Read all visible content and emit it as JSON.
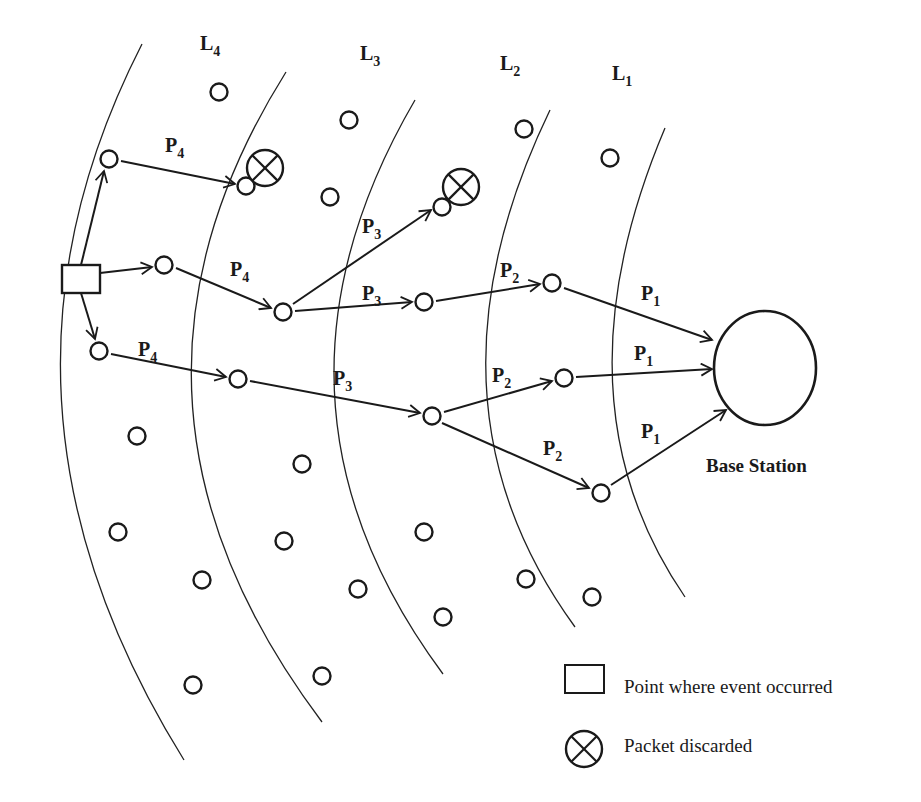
{
  "diagram": {
    "layers": [
      {
        "label": "L",
        "sub": "4",
        "x": 200,
        "y": 50
      },
      {
        "label": "L",
        "sub": "3",
        "x": 360,
        "y": 60
      },
      {
        "label": "L",
        "sub": "2",
        "x": 500,
        "y": 70
      },
      {
        "label": "L",
        "sub": "1",
        "x": 612,
        "y": 80
      }
    ],
    "boundaries": [
      "M142,44 Q-40,400 184,760",
      "M286,72 Q80,400 322,722",
      "M415,100 Q240,400 443,674",
      "M550,110 Q410,400 575,627",
      "M665,128 Q550,400 685,597"
    ],
    "event_point": {
      "x": 62,
      "y": 265,
      "w": 38,
      "h": 28
    },
    "nodes": [
      {
        "x": 219,
        "y": 92
      },
      {
        "x": 349,
        "y": 120
      },
      {
        "x": 524,
        "y": 129
      },
      {
        "x": 610,
        "y": 158
      },
      {
        "x": 109,
        "y": 159
      },
      {
        "x": 246,
        "y": 186
      },
      {
        "x": 330,
        "y": 197
      },
      {
        "x": 442,
        "y": 207
      },
      {
        "x": 164,
        "y": 265
      },
      {
        "x": 283,
        "y": 312
      },
      {
        "x": 424,
        "y": 302
      },
      {
        "x": 552,
        "y": 283
      },
      {
        "x": 99,
        "y": 351
      },
      {
        "x": 238,
        "y": 379
      },
      {
        "x": 432,
        "y": 416
      },
      {
        "x": 564,
        "y": 378
      },
      {
        "x": 601,
        "y": 493
      },
      {
        "x": 137,
        "y": 436
      },
      {
        "x": 302,
        "y": 464
      },
      {
        "x": 118,
        "y": 532
      },
      {
        "x": 284,
        "y": 541
      },
      {
        "x": 424,
        "y": 532
      },
      {
        "x": 202,
        "y": 580
      },
      {
        "x": 358,
        "y": 589
      },
      {
        "x": 526,
        "y": 579
      },
      {
        "x": 592,
        "y": 597
      },
      {
        "x": 443,
        "y": 617
      },
      {
        "x": 193,
        "y": 685
      },
      {
        "x": 322,
        "y": 676
      }
    ],
    "discarded": [
      {
        "x": 265,
        "y": 168,
        "r": 18
      },
      {
        "x": 461,
        "y": 187,
        "r": 18
      }
    ],
    "edges": [
      {
        "path": "M81,265 L104,171",
        "label": null
      },
      {
        "path": "M100,273 L152,267",
        "label": null
      },
      {
        "path": "M81,293 L95,339",
        "label": null
      },
      {
        "path": "M121,161 L235,184",
        "label": {
          "p": "P",
          "sub": "4",
          "x": 165,
          "y": 152
        }
      },
      {
        "path": "M176,268 L271,308",
        "label": {
          "p": "P",
          "sub": "4",
          "x": 230,
          "y": 276
        }
      },
      {
        "path": "M111,354 L226,377",
        "label": {
          "p": "P",
          "sub": "4",
          "x": 138,
          "y": 356
        }
      },
      {
        "path": "M293,304 L431,210",
        "label": {
          "p": "P",
          "sub": "3",
          "x": 362,
          "y": 233
        }
      },
      {
        "path": "M295,311 L412,302",
        "label": {
          "p": "P",
          "sub": "3",
          "x": 362,
          "y": 300
        }
      },
      {
        "path": "M250,381 L420,413",
        "label": {
          "p": "P",
          "sub": "3",
          "x": 333,
          "y": 385
        }
      },
      {
        "path": "M436,301 L540,284",
        "label": {
          "p": "P",
          "sub": "2",
          "x": 500,
          "y": 277
        }
      },
      {
        "path": "M444,412 L552,381",
        "label": {
          "p": "P",
          "sub": "2",
          "x": 492,
          "y": 382
        }
      },
      {
        "path": "M442,423 L589,488",
        "label": {
          "p": "P",
          "sub": "2",
          "x": 543,
          "y": 455
        }
      },
      {
        "path": "M564,288 L712,340",
        "label": {
          "p": "P",
          "sub": "1",
          "x": 641,
          "y": 300
        }
      },
      {
        "path": "M576,377 L712,369",
        "label": {
          "p": "P",
          "sub": "1",
          "x": 634,
          "y": 360
        }
      },
      {
        "path": "M611,485 L726,410",
        "label": {
          "p": "P",
          "sub": "1",
          "x": 641,
          "y": 438
        }
      }
    ],
    "node_radius": 8.5,
    "base_station": {
      "cx": 765,
      "cy": 368,
      "rx": 51,
      "ry": 57,
      "label": "Base Station",
      "label_x": 706,
      "label_y": 472
    }
  },
  "legend": {
    "items": [
      {
        "icon": "square-icon",
        "text": "Point where event occurred"
      },
      {
        "icon": "discarded-icon",
        "text": "Packet discarded"
      }
    ]
  }
}
